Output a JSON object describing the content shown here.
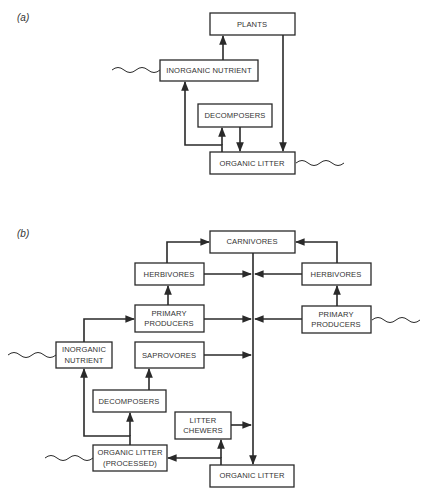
{
  "panels": {
    "a": {
      "label": "(a)",
      "nodes": {
        "plants": "PLANTS",
        "inorganic_nutrient": "INORGANIC NUTRIENT",
        "decomposers": "DECOMPOSERS",
        "organic_litter": "ORGANIC LITTER"
      },
      "edges": [
        {
          "from": "inorganic_nutrient",
          "to": "plants"
        },
        {
          "from": "plants",
          "to": "organic_litter"
        },
        {
          "from": "organic_litter",
          "to": "decomposers"
        },
        {
          "from": "decomposers",
          "to": "organic_litter"
        },
        {
          "from": "organic_litter",
          "to": "inorganic_nutrient"
        }
      ],
      "inputs_outputs": [
        "inorganic_nutrient (wavy, left)",
        "organic_litter (wavy, right)"
      ]
    },
    "b": {
      "label": "(b)",
      "nodes": {
        "carnivores": "CARNIVORES",
        "herbivores_left": "HERBIVORES",
        "herbivores_right": "HERBIVORES",
        "primary_producers_left_1": "PRIMARY",
        "primary_producers_left_2": "PRODUCERS",
        "primary_producers_right_1": "PRIMARY",
        "primary_producers_right_2": "PRODUCERS",
        "inorganic_nutrient_1": "INORGANIC",
        "inorganic_nutrient_2": "NUTRIENT",
        "saprovores": "SAPROVORES",
        "decomposers": "DECOMPOSERS",
        "litter_chewers_1": "LITTER",
        "litter_chewers_2": "CHEWERS",
        "organic_litter_processed_1": "ORGANIC LITTER",
        "organic_litter_processed_2": "(PROCESSED)",
        "organic_litter": "ORGANIC LITTER"
      },
      "edges": [
        {
          "from": "herbivores_left",
          "to": "carnivores"
        },
        {
          "from": "herbivores_right",
          "to": "carnivores"
        },
        {
          "from": "primary_producers_left",
          "to": "herbivores_left"
        },
        {
          "from": "primary_producers_right",
          "to": "herbivores_right"
        },
        {
          "from": "inorganic_nutrient",
          "to": "primary_producers_left"
        },
        {
          "from": "carnivores",
          "to": "organic_litter"
        },
        {
          "from": "herbivores_left",
          "to": "organic_litter"
        },
        {
          "from": "herbivores_right",
          "to": "organic_litter"
        },
        {
          "from": "primary_producers_left",
          "to": "organic_litter"
        },
        {
          "from": "primary_producers_right",
          "to": "organic_litter"
        },
        {
          "from": "saprovores",
          "to": "organic_litter"
        },
        {
          "from": "litter_chewers",
          "to": "organic_litter"
        },
        {
          "from": "organic_litter",
          "to": "litter_chewers"
        },
        {
          "from": "organic_litter",
          "to": "organic_litter_processed"
        },
        {
          "from": "organic_litter_processed",
          "to": "decomposers"
        },
        {
          "from": "organic_litter_processed",
          "to": "inorganic_nutrient"
        },
        {
          "from": "decomposers",
          "to": "saprovores"
        }
      ],
      "inputs_outputs": [
        "inorganic_nutrient (wavy, left)",
        "primary_producers_right (wavy, right)",
        "organic_litter_processed (wavy, left)"
      ]
    }
  }
}
